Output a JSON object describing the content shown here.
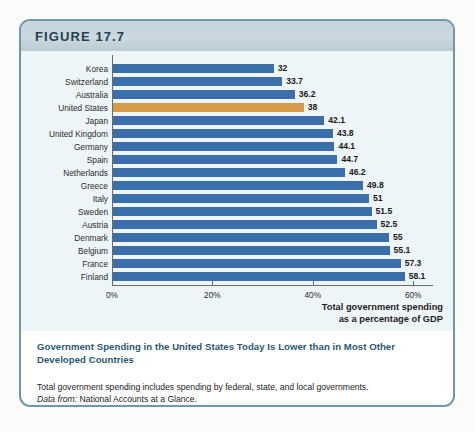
{
  "figure": {
    "label": "FIGURE 17.7",
    "caption_title": "Government Spending in the United States Today Is Lower than in Most Other Developed Countries",
    "note": "Total government spending includes spending by federal, state, and local governments.",
    "source_prefix": "Data from:",
    "source_text": "National Accounts at a Glance."
  },
  "colors": {
    "bar": "#3a6fab",
    "bar_highlight": "#d69a4a",
    "header_band": "#c5d4dc",
    "panel": "#eef5f9",
    "frame_border": "#6f98ac",
    "caption_text": "#2b5871"
  },
  "chart_data": {
    "type": "bar",
    "orientation": "horizontal",
    "title": "",
    "xlabel": "Total government spending as a percentage of GDP",
    "ylabel": "",
    "xlim": [
      0,
      64
    ],
    "xticks": [
      0,
      20,
      40,
      60
    ],
    "xtick_labels": [
      "0%",
      "20%",
      "40%",
      "60%"
    ],
    "grid": false,
    "legend": false,
    "highlight_category": "United States",
    "categories": [
      "Korea",
      "Switzerland",
      "Australia",
      "United States",
      "Japan",
      "United Kingdom",
      "Germany",
      "Spain",
      "Netherlands",
      "Greece",
      "Italy",
      "Sweden",
      "Austria",
      "Denmark",
      "Belgium",
      "France",
      "Finland"
    ],
    "values": [
      32,
      33.7,
      36.2,
      38,
      42.1,
      43.8,
      44.1,
      44.7,
      46.2,
      49.8,
      51,
      51.5,
      52.5,
      55,
      55.1,
      57.3,
      58.1
    ],
    "value_labels": [
      "32",
      "33.7",
      "36.2",
      "38",
      "42.1",
      "43.8",
      "44.1",
      "44.7",
      "46.2",
      "49.8",
      "51",
      "51.5",
      "52.5",
      "55",
      "55.1",
      "57.3",
      "58.1"
    ]
  },
  "axis_title_lines": [
    "Total government spending",
    "as a percentage of GDP"
  ]
}
